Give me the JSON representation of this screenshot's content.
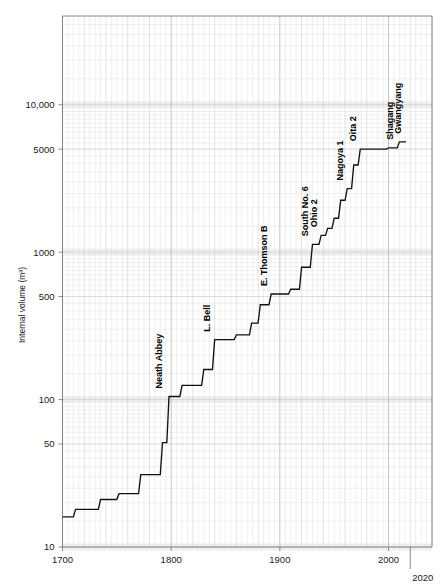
{
  "figure": {
    "background_color": "#ffffff",
    "line_color": "#111111",
    "grid_color": "#d9d9d9"
  },
  "chart_data": {
    "type": "line",
    "subtype": "step",
    "title": "",
    "xlabel": "",
    "ylabel": "Internal volume (m³)",
    "yscale": "log",
    "xscale": "linear",
    "xlim": [
      1700,
      2040
    ],
    "ylim": [
      10,
      40000
    ],
    "grid": true,
    "legend": null,
    "x_tick_labels": [
      "1700",
      "1800",
      "1900",
      "2000",
      "2020"
    ],
    "x_ticks": [
      1700,
      1800,
      1900,
      2000,
      2020
    ],
    "y_tick_labels": [
      "10",
      "50",
      "100",
      "500",
      "1000",
      "5000",
      "10,000"
    ],
    "y_ticks": [
      10,
      50,
      100,
      500,
      1000,
      5000,
      10000
    ],
    "series": [
      {
        "name": "Blast furnace internal volume",
        "x": [
          1700,
          1710,
          1712,
          1733,
          1735,
          1750,
          1752,
          1770,
          1772,
          1790,
          1792,
          1796,
          1798,
          1808,
          1810,
          1828,
          1830,
          1838,
          1840,
          1858,
          1860,
          1872,
          1874,
          1880,
          1882,
          1890,
          1892,
          1908,
          1910,
          1918,
          1920,
          1928,
          1930,
          1936,
          1938,
          1942,
          1944,
          1948,
          1950,
          1954,
          1956,
          1960,
          1962,
          1966,
          1968,
          1972,
          1974,
          1998,
          2000,
          2008,
          2010,
          2016
        ],
        "y": [
          16,
          16,
          18,
          18,
          21,
          21,
          23,
          23,
          31,
          31,
          51,
          51,
          105,
          105,
          125,
          125,
          160,
          160,
          255,
          255,
          275,
          275,
          330,
          330,
          440,
          440,
          520,
          520,
          560,
          560,
          790,
          790,
          1130,
          1130,
          1300,
          1300,
          1450,
          1450,
          1700,
          1700,
          2250,
          2250,
          2700,
          2700,
          3900,
          3900,
          5000,
          5000,
          5100,
          5100,
          5600,
          5600
        ],
        "annotations": [
          {
            "label": "Neath Abbey",
            "x": 1796,
            "y": 105
          },
          {
            "label": "L. Bell",
            "x": 1840,
            "y": 255
          },
          {
            "label": "E. Thomson B",
            "x": 1892,
            "y": 520
          },
          {
            "label": "South No. 6",
            "x": 1930,
            "y": 1130
          },
          {
            "label": "Ohio 2",
            "x": 1938,
            "y": 1300
          },
          {
            "label": "Nagoya 1",
            "x": 1962,
            "y": 2700
          },
          {
            "label": "Oita 2",
            "x": 1974,
            "y": 5000
          },
          {
            "label": "Shagang",
            "x": 2008,
            "y": 5100
          },
          {
            "label": "Gwangyang",
            "x": 2016,
            "y": 5600
          }
        ]
      }
    ]
  },
  "axes": {
    "y_title": "Internal volume (m³)",
    "y_labels": [
      {
        "text": "10,000",
        "value": 10000
      },
      {
        "text": "5000",
        "value": 5000
      },
      {
        "text": "1000",
        "value": 1000
      },
      {
        "text": "500",
        "value": 500
      },
      {
        "text": "100",
        "value": 100
      },
      {
        "text": "50",
        "value": 50
      },
      {
        "text": "10",
        "value": 10
      }
    ],
    "x_labels": [
      {
        "text": "1700",
        "value": 1700
      },
      {
        "text": "1800",
        "value": 1800
      },
      {
        "text": "1900",
        "value": 1900
      },
      {
        "text": "2000",
        "value": 2000
      }
    ],
    "x_label_extra": {
      "text": "2020",
      "value": 2020
    }
  },
  "annotation_labels": {
    "neath_abbey": "Neath Abbey",
    "l_bell": "L. Bell",
    "e_thomson_b": "E. Thomson B",
    "south_no_6": "South No. 6",
    "ohio_2": "Ohio 2",
    "nagoya_1": "Nagoya 1",
    "oita_2": "Oita 2",
    "shagang": "Shagang",
    "gwangyang": "Gwangyang"
  }
}
